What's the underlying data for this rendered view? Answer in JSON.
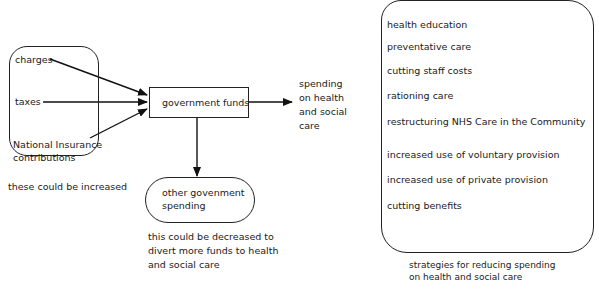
{
  "sources": {
    "items": [
      "charges",
      "taxes",
      "National Insurance",
      "contributions"
    ],
    "caption": "these could be increased"
  },
  "center": {
    "label": "government funds"
  },
  "other_spending": {
    "line1": "other govenment",
    "line2": "spending",
    "caption_lines": [
      "this could be decreased to",
      "divert more funds to health",
      "and social care"
    ]
  },
  "output_label": {
    "lines": [
      "spending",
      "on health",
      "and social",
      "care"
    ]
  },
  "strategies": {
    "items": [
      "health education",
      "preventative care",
      "cutting staff costs",
      "rationing care",
      "restructuring NHS Care in the Community",
      "increased use of voluntary provision",
      "increased use of private provision",
      "cutting benefits"
    ],
    "caption_lines": [
      "strategies for reducing spending",
      "on health and social care"
    ]
  }
}
